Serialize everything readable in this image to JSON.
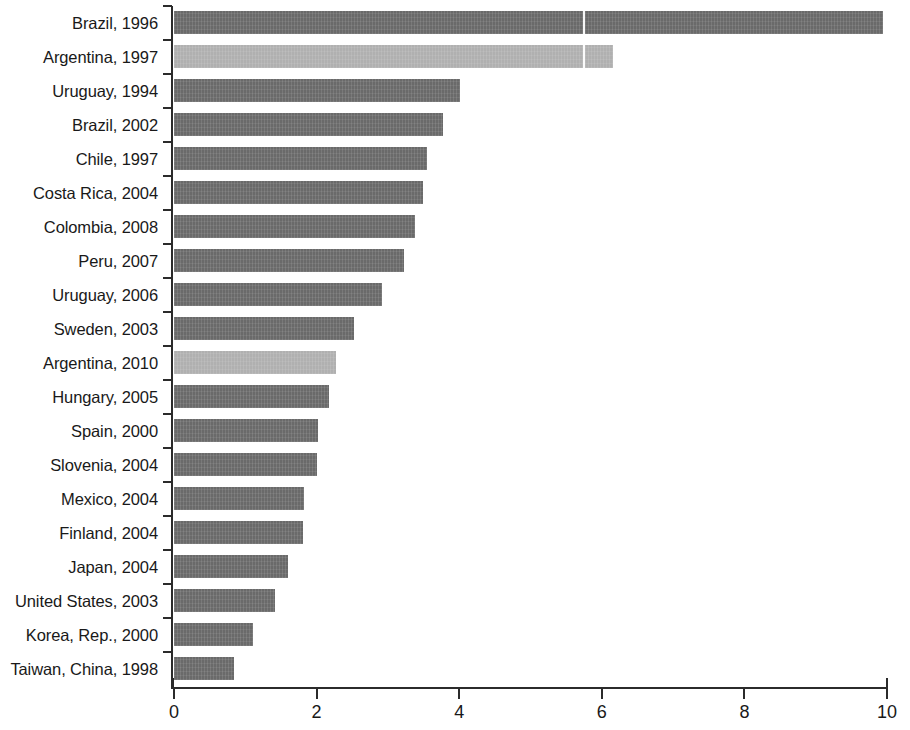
{
  "chart_data": {
    "type": "bar",
    "orientation": "horizontal",
    "title": "",
    "subtitle": "",
    "xlabel": "",
    "ylabel": "",
    "xlim": [
      0,
      10
    ],
    "xticks": [
      0,
      2,
      4,
      6,
      8,
      10
    ],
    "xtick_labels": [
      "0",
      "2",
      "4",
      "6",
      "8",
      "10"
    ],
    "grid": false,
    "legend": null,
    "colors": {
      "default_bar": "#6a6a6a",
      "highlight_bar": "#b0b0b0",
      "axis": "#2b2b2b",
      "text": "#191919",
      "background": "#ffffff"
    },
    "categories": [
      "Brazil, 1996",
      "Argentina, 1997",
      "Uruguay, 1994",
      "Brazil, 2002",
      "Chile, 1997",
      "Costa Rica, 2004",
      "Colombia, 2008",
      "Peru, 2007",
      "Uruguay, 2006",
      "Sweden, 2003",
      "Argentina, 2010",
      "Hungary, 2005",
      "Spain, 2000",
      "Slovenia, 2004",
      "Mexico, 2004",
      "Finland, 2004",
      "Japan, 2004",
      "United States, 2003",
      "Korea, Rep., 2000",
      "Taiwan, China, 1998"
    ],
    "values": [
      9.95,
      6.16,
      4.01,
      3.77,
      3.55,
      3.49,
      3.38,
      3.23,
      2.92,
      2.52,
      2.27,
      2.18,
      2.02,
      2.0,
      1.82,
      1.81,
      1.6,
      1.42,
      1.11,
      0.84
    ],
    "highlighted": [
      "Argentina, 1997",
      "Argentina, 2010"
    ],
    "bars": [
      {
        "category": "Brazil, 1996",
        "value": 9.95,
        "highlight": false
      },
      {
        "category": "Argentina, 1997",
        "value": 6.16,
        "highlight": true
      },
      {
        "category": "Uruguay, 1994",
        "value": 4.01,
        "highlight": false
      },
      {
        "category": "Brazil, 2002",
        "value": 3.77,
        "highlight": false
      },
      {
        "category": "Chile, 1997",
        "value": 3.55,
        "highlight": false
      },
      {
        "category": "Costa Rica, 2004",
        "value": 3.49,
        "highlight": false
      },
      {
        "category": "Colombia, 2008",
        "value": 3.38,
        "highlight": false
      },
      {
        "category": "Peru, 2007",
        "value": 3.23,
        "highlight": false
      },
      {
        "category": "Uruguay, 2006",
        "value": 2.92,
        "highlight": false
      },
      {
        "category": "Sweden, 2003",
        "value": 2.52,
        "highlight": false
      },
      {
        "category": "Argentina, 2010",
        "value": 2.27,
        "highlight": true
      },
      {
        "category": "Hungary, 2005",
        "value": 2.18,
        "highlight": false
      },
      {
        "category": "Spain, 2000",
        "value": 2.02,
        "highlight": false
      },
      {
        "category": "Slovenia, 2004",
        "value": 2.0,
        "highlight": false
      },
      {
        "category": "Mexico, 2004",
        "value": 1.82,
        "highlight": false
      },
      {
        "category": "Finland, 2004",
        "value": 1.81,
        "highlight": false
      },
      {
        "category": "Japan, 2004",
        "value": 1.6,
        "highlight": false
      },
      {
        "category": "United States, 2003",
        "value": 1.42,
        "highlight": false
      },
      {
        "category": "Korea, Rep., 2000",
        "value": 1.11,
        "highlight": false
      },
      {
        "category": "Taiwan, China, 1998",
        "value": 0.84,
        "highlight": false
      }
    ]
  }
}
